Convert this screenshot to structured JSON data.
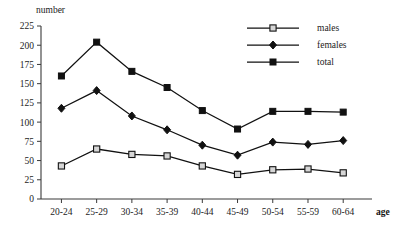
{
  "chart_data": {
    "type": "line",
    "title": "",
    "xlabel": "age",
    "ylabel": "number",
    "ylim": [
      0,
      225
    ],
    "yticks": [
      0,
      25,
      50,
      75,
      100,
      125,
      150,
      175,
      200,
      225
    ],
    "grid": false,
    "legend_position": "top-right",
    "categories": [
      "20-24",
      "25-29",
      "30-34",
      "35-39",
      "40-44",
      "45-49",
      "50-54",
      "55-59",
      "60-64"
    ],
    "series": [
      {
        "name": "males",
        "marker": "open-square",
        "values": [
          43,
          65,
          58,
          56,
          43,
          32,
          38,
          39,
          34
        ]
      },
      {
        "name": "females",
        "marker": "filled-diamond",
        "values": [
          118,
          141,
          108,
          90,
          70,
          57,
          74,
          71,
          76
        ]
      },
      {
        "name": "total",
        "marker": "filled-square",
        "values": [
          160,
          204,
          166,
          145,
          115,
          91,
          114,
          114,
          113
        ]
      }
    ]
  },
  "axes": {
    "y_title": "number",
    "x_title": "age"
  },
  "legend": {
    "entries": [
      {
        "label": "males"
      },
      {
        "label": "females"
      },
      {
        "label": "total"
      }
    ]
  },
  "colors": {
    "line": "#111111",
    "axis": "#3a3a3a",
    "open_marker_fill": "#d6d6d6",
    "background": "#ffffff"
  }
}
